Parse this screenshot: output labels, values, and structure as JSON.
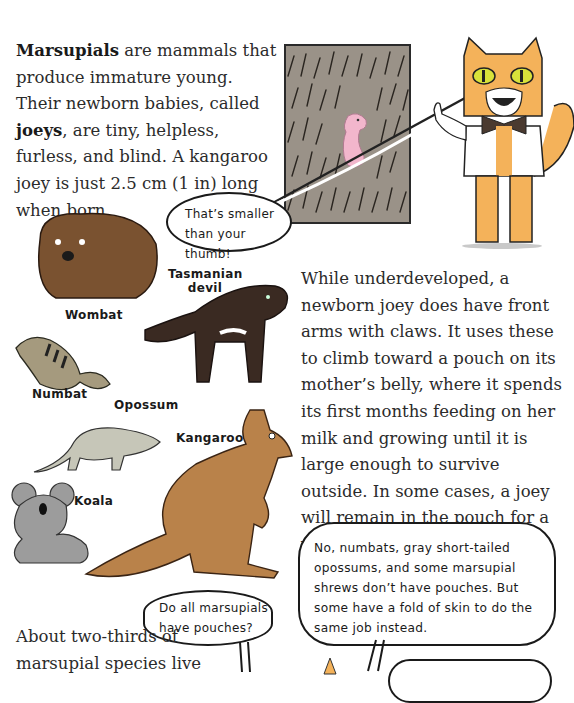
{
  "paragraphs": {
    "intro": {
      "term1": "Marsupials",
      "text1": " are mammals that produce immature young. Their newborn babies, called ",
      "term2": "joeys",
      "text2": ", are tiny, helpless, furless, and blind. A kangaroo joey is just 2.5 cm (1 in) long when born."
    },
    "development": "While underdeveloped, a newborn joey does have front arms with claws. It uses these to climb toward a pouch on its mother’s belly, where it spends its first months feeding on her milk and growing until it is large enough to survive outside. In some cases, a joey will remain in the pouch for a year.",
    "distribution": "About two-thirds of marsupial species live"
  },
  "speech_bubbles": {
    "thumb": "That’s smaller than your thumb!",
    "question": "Do all marsupials have pouches?",
    "answer": "No, numbats, gray short-tailed opossums, and some marsupial shrews don’t have pouches. But some have a fold of skin to do the same job instead."
  },
  "animal_labels": {
    "wombat": "Wombat",
    "tasmanian_devil": "Tasmanian devil",
    "numbat": "Numbat",
    "opossum": "Opossum",
    "kangaroo": "Kangaroo",
    "koala": "Koala"
  },
  "colors": {
    "fur_panel": "#9a9288",
    "joey_pink": "#f2b6cc",
    "cat_orange": "#f4b25a",
    "cat_eye": "#d8e23a",
    "wombat_brown": "#7a5230",
    "devil_dark": "#3a2a22",
    "kangaroo_tan": "#b9824a",
    "koala_gray": "#9c9c9c",
    "opossum_gray": "#c6c6b8"
  }
}
